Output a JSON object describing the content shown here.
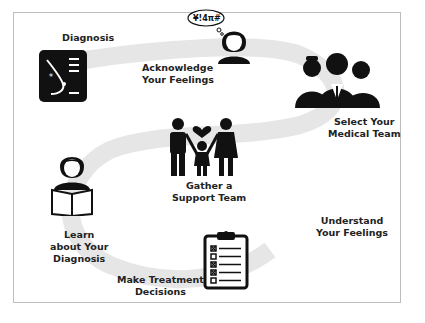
{
  "colors": {
    "ribbon": "#e6e6e6",
    "icon": "#111111",
    "text": "#222222",
    "border": "#bdbdbd"
  },
  "steps": [
    {
      "id": "diagnosis",
      "lines": [
        "Diagnosis"
      ],
      "icon": "breast-scan-icon"
    },
    {
      "id": "acknowledge",
      "lines": [
        "Acknowledge",
        "Your Feelings"
      ],
      "icon": "upset-woman-icon",
      "thought": "¥!4π#"
    },
    {
      "id": "medical-team",
      "lines": [
        "Select Your",
        "Medical Team"
      ],
      "icon": "medical-team-icon"
    },
    {
      "id": "support-team",
      "lines": [
        "Gather a",
        "Support Team"
      ],
      "icon": "family-icon"
    },
    {
      "id": "learn",
      "lines": [
        "Learn",
        "about Your",
        "Diagnosis"
      ],
      "icon": "reading-woman-icon"
    },
    {
      "id": "understand",
      "lines": [
        "Understand",
        "Your Feelings"
      ],
      "icon": null
    },
    {
      "id": "treatment",
      "lines": [
        "Make Treatment",
        "Decisions"
      ],
      "icon": "clipboard-checklist-icon"
    }
  ]
}
